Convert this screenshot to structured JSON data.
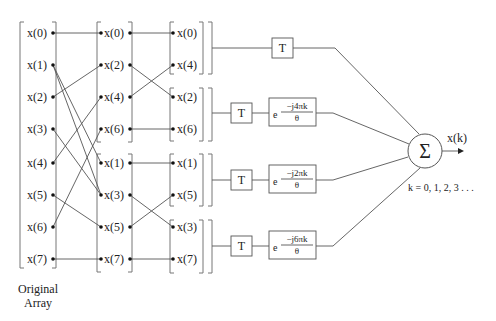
{
  "diagram": {
    "column1": {
      "caption_line1": "Original",
      "caption_line2": "Array",
      "items": [
        "x(0)",
        "x(1)",
        "x(2)",
        "x(3)",
        "x(4)",
        "x(5)",
        "x(6)",
        "x(7)"
      ]
    },
    "column2": {
      "items": [
        "x(0)",
        "x(2)",
        "x(4)",
        "x(6)",
        "x(1)",
        "x(3)",
        "x(5)",
        "x(7)"
      ]
    },
    "column3": {
      "items": [
        "x(0)",
        "x(4)",
        "x(2)",
        "x(6)",
        "x(1)",
        "x(5)",
        "x(3)",
        "x(7)"
      ]
    },
    "branches": [
      {
        "delay": "T",
        "twiddle": null
      },
      {
        "delay": "T",
        "twiddle": {
          "base": "e",
          "exponent": "−j4πk",
          "denominator": "θ"
        }
      },
      {
        "delay": "T",
        "twiddle": {
          "base": "e",
          "exponent": "−j2πk",
          "denominator": "θ"
        }
      },
      {
        "delay": "T",
        "twiddle": {
          "base": "e",
          "exponent": "−j6πk",
          "denominator": "θ"
        }
      }
    ],
    "summer": {
      "symbol": "Σ"
    },
    "output": {
      "label": "x(k)",
      "k_range": "k = 0, 1, 2, 3 . . ."
    }
  }
}
